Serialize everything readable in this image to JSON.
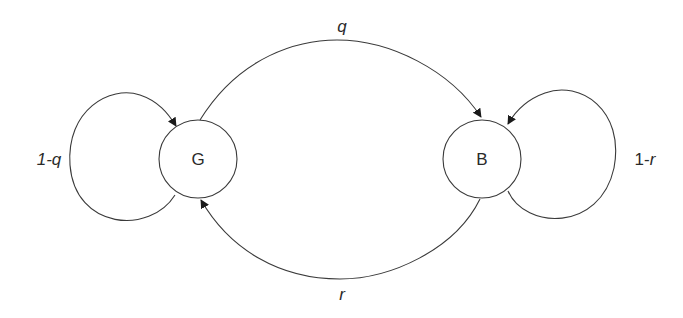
{
  "diagram": {
    "type": "state-transition-diagram",
    "nodes": [
      {
        "id": "G",
        "label": "G"
      },
      {
        "id": "B",
        "label": "B"
      }
    ],
    "edges": [
      {
        "from": "G",
        "to": "G",
        "label_prefix": "1-",
        "label_var": "q"
      },
      {
        "from": "G",
        "to": "B",
        "label": "q"
      },
      {
        "from": "B",
        "to": "G",
        "label": "r"
      },
      {
        "from": "B",
        "to": "B",
        "label_prefix": "1-",
        "label_var": "r"
      }
    ]
  }
}
